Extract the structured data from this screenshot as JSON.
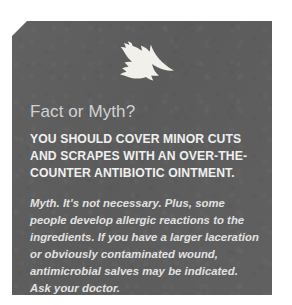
{
  "callout": {
    "icon": "leaf-icon",
    "title": "Fact or Myth?",
    "claim": "YOU SHOULD COVER MINOR CUTS AND SCRAPES WITH AN OVER-THE-COUNTER ANTIBIOTIC OINTMENT.",
    "answer": "Myth. It's not necessary. Plus, some people develop allergic reactions to the ingredients. If you have a larger laceration or obviously contaminated wound, antimicrobial salves may be indicated. Ask your doctor.",
    "colors": {
      "panel_background": "#5e5e5e",
      "page_background": "#ffffff",
      "title_text": "#d2d2d2",
      "claim_text": "#f0f0f0",
      "answer_text": "#e2e2e2",
      "leaf": "#f2f0ea"
    }
  }
}
